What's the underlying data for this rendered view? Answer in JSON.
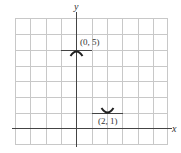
{
  "graph": {
    "x_axis_label": "x",
    "y_axis_label": "y",
    "points": [
      {
        "label": "(0, 5)",
        "x": 0,
        "y": 5,
        "type": "relative maximum"
      },
      {
        "label": "(2, 1)",
        "x": 2,
        "y": 1,
        "type": "relative minimum"
      }
    ],
    "grid": {
      "x_min": -4,
      "x_max": 6,
      "y_min": -1,
      "y_max": 7
    }
  }
}
